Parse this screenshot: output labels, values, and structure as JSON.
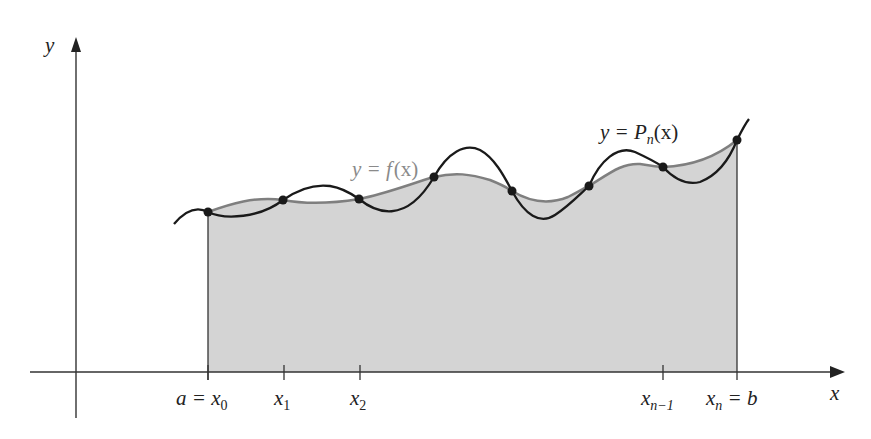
{
  "diagram": {
    "title": "",
    "colors": {
      "fill": "#d4d4d4",
      "f_curve": "#7f7f7f",
      "p_curve": "#1a1a1a",
      "axis": "#333333",
      "f_label": "#8a8a8a",
      "text": "#222222"
    },
    "axes": {
      "x_label": "x",
      "y_label": "y"
    },
    "curves": {
      "f": {
        "label_lhs": "y = ",
        "label_fn": "f",
        "label_arg": "(x)"
      },
      "p": {
        "label_lhs": "y = ",
        "label_fn": "P",
        "label_sub": "n",
        "label_arg": "(x)"
      }
    },
    "ticks": [
      {
        "main": "a = x",
        "sub": "0"
      },
      {
        "main": "x",
        "sub": "1"
      },
      {
        "main": "x",
        "sub": "2"
      },
      {
        "main": "x",
        "sub": "n−1"
      },
      {
        "main": "x",
        "sub": "n",
        "suffix": " = b"
      }
    ],
    "nodes": [
      {
        "x": 208,
        "y": 212
      },
      {
        "x": 283,
        "y": 200
      },
      {
        "x": 359,
        "y": 199
      },
      {
        "x": 434,
        "y": 177
      },
      {
        "x": 512,
        "y": 191
      },
      {
        "x": 589,
        "y": 186
      },
      {
        "x": 663,
        "y": 167
      },
      {
        "x": 737,
        "y": 140
      }
    ]
  }
}
